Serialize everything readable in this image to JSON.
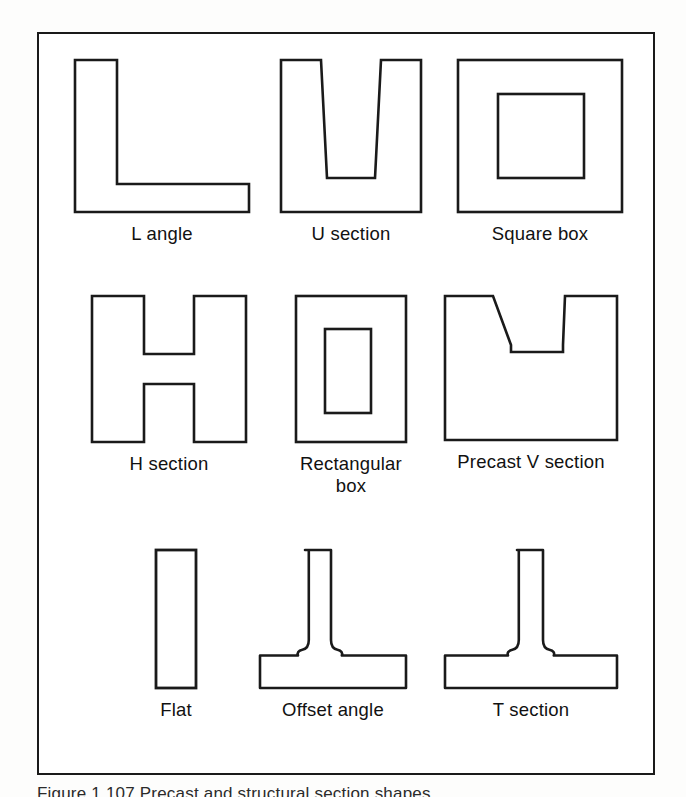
{
  "figure": {
    "caption": "Figure 1.107  Precast and structural section shapes",
    "frame_color": "#1a1a1a",
    "outline_color": "#1a1a1a",
    "fill_color": "#ffffff",
    "page_background": "#fdfdfc"
  },
  "shapes": [
    {
      "id": "l-angle",
      "label": "L angle",
      "row": 1,
      "column": 1,
      "description": "L-shaped angle profile with vertical leg and horizontal leg"
    },
    {
      "id": "u-section",
      "label": "U section",
      "row": 1,
      "column": 2,
      "description": "Channel profile open at the top with slightly tapered inner walls"
    },
    {
      "id": "square-box",
      "label": "Square box",
      "row": 1,
      "column": 3,
      "description": "Square hollow section, square outer with square inner void"
    },
    {
      "id": "h-section",
      "label": "H section",
      "row": 2,
      "column": 1,
      "description": "H or I profile with two flanges joined by a central web"
    },
    {
      "id": "rectangular-box",
      "label": "Rectangular\nbox",
      "row": 2,
      "column": 2,
      "description": "Rectangular hollow section, rectangular outer with rectangular inner void"
    },
    {
      "id": "precast-v-section",
      "label": "Precast V section",
      "row": 2,
      "column": 3,
      "description": "Solid block with a trapezoidal V notch cut into the top, flat notch bottom"
    },
    {
      "id": "flat",
      "label": "Flat",
      "row": 3,
      "column": 1,
      "description": "Narrow solid flat bar shown upright"
    },
    {
      "id": "offset-angle",
      "label": "Offset angle",
      "row": 3,
      "column": 2,
      "description": "Tee profile with the stem offset left of the flange centre, filleted root"
    },
    {
      "id": "t-section",
      "label": "T section",
      "row": 3,
      "column": 3,
      "description": "Tee profile with the stem centred on the flange, filleted root"
    }
  ]
}
